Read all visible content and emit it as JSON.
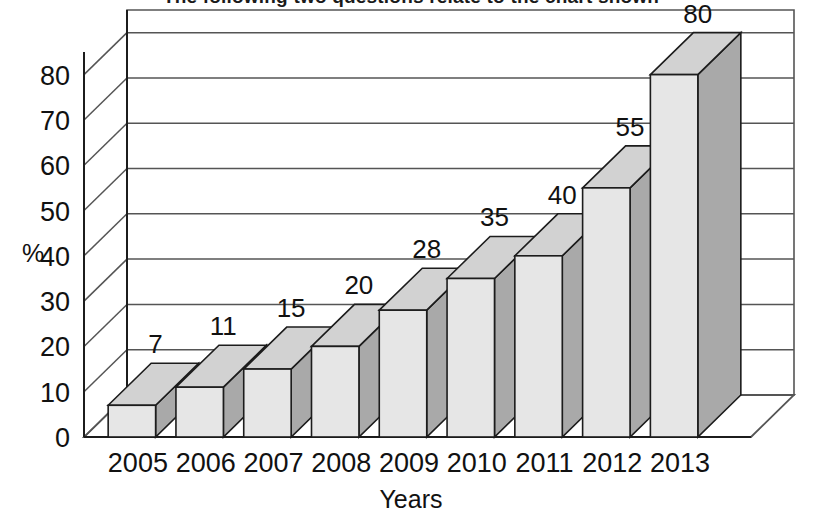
{
  "page": {
    "heading_partial": "The following two questions relate to the chart shown"
  },
  "chart_data": {
    "type": "bar",
    "title": "% of children owning a mobile phone",
    "xlabel": "Years",
    "ylabel": "%",
    "categories": [
      "2005",
      "2006",
      "2007",
      "2008",
      "2009",
      "2010",
      "2011",
      "2012",
      "2013"
    ],
    "values": [
      7,
      11,
      15,
      20,
      28,
      35,
      40,
      55,
      80
    ],
    "value_labels": [
      "7",
      "11",
      "15",
      "20",
      "28",
      "35",
      "40",
      "55",
      "80"
    ],
    "yticks": [
      0,
      10,
      20,
      30,
      40,
      50,
      60,
      70,
      80
    ],
    "ytick_labels": [
      "0",
      "10",
      "20",
      "30",
      "40",
      "50",
      "60",
      "70",
      "80"
    ],
    "ylim": [
      0,
      85
    ],
    "grid": true,
    "legend": "none",
    "style": "3d-column",
    "colors": {
      "bar_front": "#e6e6e6",
      "bar_side": "#a9a9a9",
      "bar_top": "#d2d2d2",
      "outline": "#1c1c1c",
      "gridline": "#555555",
      "wall": "#ffffff",
      "text": "#111111"
    }
  }
}
